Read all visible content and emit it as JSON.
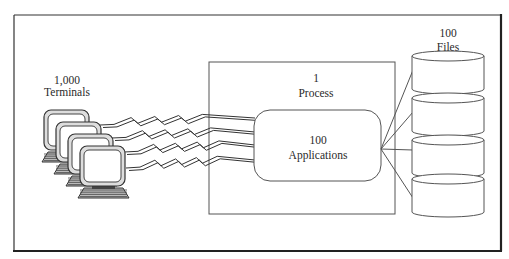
{
  "diagram": {
    "terminals": {
      "count_label": "1,000",
      "name_label": "Terminals",
      "icon": "computer-terminal-icon",
      "drawn_count": 4
    },
    "process": {
      "count_label": "1",
      "name_label": "Process"
    },
    "applications": {
      "count_label": "100",
      "name_label": "Applications"
    },
    "files": {
      "count_label": "100",
      "name_label": "Files",
      "icon": "database-cylinder-icon",
      "drawn_count": 4
    },
    "connections": [
      {
        "from": "terminals",
        "to": "applications",
        "style": "lightning-bolt",
        "count": 4
      },
      {
        "from": "applications",
        "to": "files",
        "style": "straight-line",
        "count": 4
      }
    ]
  }
}
